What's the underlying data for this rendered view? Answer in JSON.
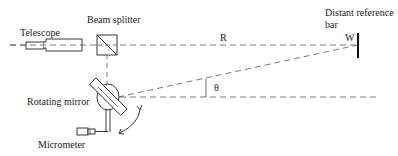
{
  "labels": {
    "telescope": "Telescope",
    "beam_splitter": "Beam splitter",
    "distant_reference_bar_line1": "Distant reference",
    "distant_reference_bar_line2": "bar",
    "rotating_mirror": "Rotating mirror",
    "micrometer": "Micrometer",
    "distance": "R",
    "width": "W",
    "angle": "θ"
  },
  "colors": {
    "stroke": "#222222",
    "dashed": "#555555",
    "background": "#ffffff"
  }
}
